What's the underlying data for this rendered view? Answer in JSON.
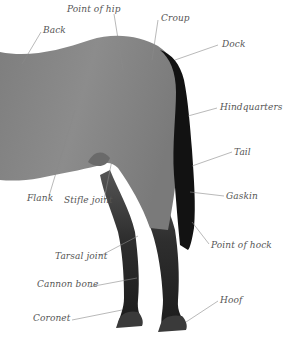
{
  "diagram": {
    "colors": {
      "body": "#8a8a8a",
      "body_dark": "#6e6e6e",
      "legs": "#2a2a2a",
      "tail": "#111111",
      "leader_line": "#888888",
      "label_text": "#555555"
    },
    "labels": [
      {
        "id": "point-of-hip",
        "text": "Point of hip",
        "x": 67,
        "y": 5
      },
      {
        "id": "croup",
        "text": "Croup",
        "x": 161,
        "y": 14
      },
      {
        "id": "back",
        "text": "Back",
        "x": 43,
        "y": 26
      },
      {
        "id": "dock",
        "text": "Dock",
        "x": 222,
        "y": 40
      },
      {
        "id": "hindquarters",
        "text": "Hindquarters",
        "x": 220,
        "y": 103
      },
      {
        "id": "tail",
        "text": "Tail",
        "x": 234,
        "y": 148
      },
      {
        "id": "gaskin",
        "text": "Gaskin",
        "x": 226,
        "y": 192
      },
      {
        "id": "flank",
        "text": "Flank",
        "x": 27,
        "y": 194
      },
      {
        "id": "stifle-joint",
        "text": "Stifle joint",
        "x": 64,
        "y": 196
      },
      {
        "id": "point-of-hock",
        "text": "Point of hock",
        "x": 211,
        "y": 241
      },
      {
        "id": "tarsal-joint",
        "text": "Tarsal joint",
        "x": 55,
        "y": 252
      },
      {
        "id": "cannon-bone",
        "text": "Cannon bone",
        "x": 37,
        "y": 280
      },
      {
        "id": "hoof",
        "text": "Hoof",
        "x": 220,
        "y": 296
      },
      {
        "id": "coronet",
        "text": "Coronet",
        "x": 33,
        "y": 314
      }
    ]
  }
}
